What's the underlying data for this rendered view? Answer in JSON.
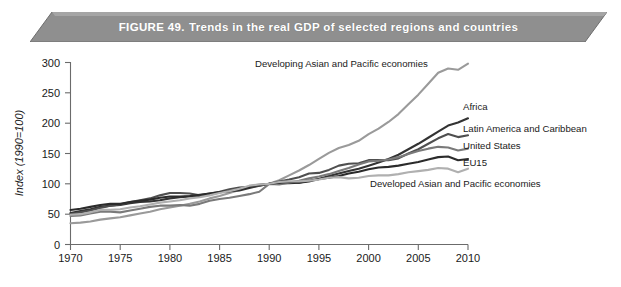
{
  "figure": {
    "label": "FIGURE 49.",
    "title": "Trends in the real GDP of selected regions and countries",
    "banner_color": "#8c8c8c",
    "banner_text_color": "#ffffff"
  },
  "chart_data": {
    "type": "line",
    "title": "Trends in the real GDP of selected regions and countries",
    "xlabel": "",
    "ylabel": "Index  (1990=100)",
    "xlim": [
      1970,
      2010
    ],
    "ylim": [
      0,
      300
    ],
    "xticks": [
      1970,
      1975,
      1980,
      1985,
      1990,
      1995,
      2000,
      2005,
      2010
    ],
    "yticks": [
      0,
      50,
      100,
      150,
      200,
      250,
      300
    ],
    "grid": false,
    "legend": "inline-right-labels",
    "x": [
      1970,
      1971,
      1972,
      1973,
      1974,
      1975,
      1976,
      1977,
      1978,
      1979,
      1980,
      1981,
      1982,
      1983,
      1984,
      1985,
      1986,
      1987,
      1988,
      1989,
      1990,
      1991,
      1992,
      1993,
      1994,
      1995,
      1996,
      1997,
      1998,
      1999,
      2000,
      2001,
      2002,
      2003,
      2004,
      2005,
      2006,
      2007,
      2008,
      2009,
      2010
    ],
    "series": [
      {
        "name": "Developing Asian and Pacific economies",
        "color": "#9a9a9a",
        "label_position": "top-center",
        "values": [
          35,
          36,
          38,
          41,
          43,
          45,
          48,
          51,
          54,
          58,
          61,
          64,
          67,
          71,
          76,
          80,
          85,
          90,
          96,
          99,
          100,
          106,
          114,
          122,
          131,
          141,
          151,
          159,
          164,
          171,
          182,
          191,
          202,
          215,
          231,
          247,
          265,
          283,
          290,
          288,
          298
        ]
      },
      {
        "name": "Africa",
        "color": "#333333",
        "label_position": "right",
        "values": [
          52,
          55,
          58,
          62,
          64,
          65,
          68,
          70,
          71,
          73,
          76,
          78,
          79,
          79,
          82,
          86,
          88,
          89,
          93,
          97,
          100,
          101,
          101,
          102,
          104,
          108,
          113,
          117,
          121,
          125,
          130,
          135,
          141,
          148,
          157,
          166,
          176,
          186,
          196,
          201,
          208
        ]
      },
      {
        "name": "Latin America and Caribbean",
        "color": "#4f4f4f",
        "label_position": "right",
        "values": [
          50,
          53,
          56,
          60,
          64,
          66,
          70,
          73,
          76,
          81,
          85,
          85,
          84,
          81,
          84,
          87,
          91,
          94,
          95,
          97,
          100,
          104,
          107,
          111,
          117,
          118,
          123,
          130,
          133,
          134,
          139,
          139,
          139,
          142,
          150,
          157,
          166,
          175,
          182,
          177,
          180
        ]
      },
      {
        "name": "United States",
        "color": "#7a7a7a",
        "label_position": "right",
        "values": [
          47,
          48,
          51,
          54,
          54,
          53,
          56,
          59,
          62,
          64,
          64,
          65,
          64,
          67,
          72,
          75,
          77,
          80,
          83,
          87,
          100,
          99,
          102,
          105,
          109,
          112,
          116,
          121,
          126,
          132,
          137,
          138,
          140,
          144,
          149,
          154,
          158,
          161,
          160,
          155,
          158
        ]
      },
      {
        "name": "EU15",
        "color": "#2b2b2b",
        "label_position": "right",
        "values": [
          57,
          59,
          62,
          65,
          67,
          67,
          70,
          72,
          74,
          77,
          79,
          79,
          80,
          82,
          84,
          86,
          88,
          91,
          95,
          98,
          100,
          102,
          103,
          102,
          105,
          108,
          110,
          113,
          117,
          120,
          124,
          127,
          128,
          130,
          133,
          136,
          140,
          144,
          145,
          139,
          141
        ]
      },
      {
        "name": "Developed Asian and Pacific economies",
        "color": "#b0b0b0",
        "label_position": "bottom-right",
        "values": [
          49,
          50,
          53,
          57,
          57,
          58,
          61,
          63,
          66,
          69,
          71,
          73,
          76,
          78,
          81,
          85,
          88,
          92,
          97,
          99,
          100,
          103,
          104,
          104,
          105,
          107,
          110,
          111,
          109,
          110,
          113,
          114,
          114,
          116,
          119,
          121,
          123,
          126,
          125,
          119,
          125
        ]
      }
    ],
    "annotations": [
      {
        "text": "Developing Asian and Pacific economies",
        "x": 1988,
        "y": 283
      },
      {
        "text": "Africa",
        "x": 2011,
        "y": 218
      },
      {
        "text": "Latin America and Caribbean",
        "x": 2011,
        "y": 182
      },
      {
        "text": "United States",
        "x": 2011,
        "y": 155
      },
      {
        "text": "EU15",
        "x": 2011,
        "y": 128
      },
      {
        "text": "Developed Asian and Pacific economies",
        "x": 2000,
        "y": 96
      }
    ]
  },
  "axis": {
    "y_title": "Index  (1990=100)",
    "y_tick_labels": [
      "300",
      "250",
      "200",
      "150",
      "100",
      "50",
      "0"
    ],
    "x_tick_labels": [
      "1970",
      "1975",
      "1980",
      "1985",
      "1990",
      "1995",
      "2000",
      "2005",
      "2010"
    ]
  },
  "labels": {
    "developing_asia": "Developing Asian and Pacific economies",
    "africa": "Africa",
    "latin_america": "Latin America and Caribbean",
    "united_states": "United States",
    "eu15": "EU15",
    "developed_asia": "Developed Asian and Pacific economies"
  }
}
